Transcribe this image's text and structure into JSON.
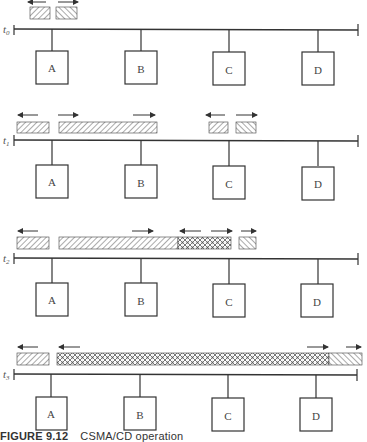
{
  "figure": {
    "caption_number": "FIGURE 9.12",
    "caption_text": "CSMA/CD operation"
  },
  "stations": [
    "A",
    "B",
    "C",
    "D"
  ],
  "panels": [
    {
      "time_label": "t",
      "time_sub": "0",
      "frames": [
        {
          "x1": 30,
          "x2": 50,
          "fill": "hatch-fwd",
          "arrow": "left"
        },
        {
          "x1": 56,
          "x2": 77,
          "fill": "hatch-back",
          "arrow": "right"
        }
      ]
    },
    {
      "time_label": "t",
      "time_sub": "1",
      "frames": [
        {
          "x1": 17,
          "x2": 49,
          "fill": "hatch-fwd",
          "arrow": "left"
        },
        {
          "x1": 59,
          "x2": 157,
          "fill": "hatch-fwd",
          "arrow": "right-both"
        },
        {
          "x1": 209,
          "x2": 228,
          "fill": "hatch-fwd",
          "arrow": "left"
        },
        {
          "x1": 236,
          "x2": 256,
          "fill": "hatch-back",
          "arrow": "right"
        }
      ]
    },
    {
      "time_label": "t",
      "time_sub": "2",
      "frames": [
        {
          "x1": 17,
          "x2": 49,
          "fill": "hatch-fwd",
          "arrow": "left"
        },
        {
          "x1": 59,
          "x2": 178,
          "fill": "hatch-fwd",
          "arrow": "right-end"
        },
        {
          "x1": 178,
          "x2": 231,
          "fill": "crosshatch",
          "arrow": "both"
        },
        {
          "x1": 239,
          "x2": 256,
          "fill": "hatch-back",
          "arrow": "right"
        }
      ]
    },
    {
      "time_label": "t",
      "time_sub": "3",
      "frames": [
        {
          "x1": 17,
          "x2": 49,
          "fill": "hatch-fwd",
          "arrow": "left"
        },
        {
          "x1": 57,
          "x2": 329,
          "fill": "crosshatch",
          "arrow": "left-start-right-end"
        },
        {
          "x1": 329,
          "x2": 362,
          "fill": "hatch-back",
          "arrow": "right"
        }
      ]
    }
  ]
}
